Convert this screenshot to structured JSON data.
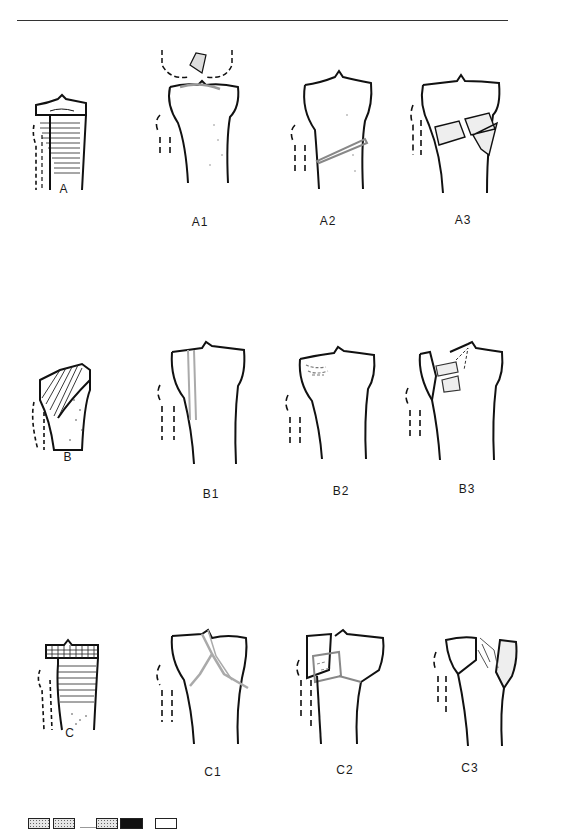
{
  "figure": {
    "type": "fracture-classification-diagram",
    "rows": [
      {
        "group": "A",
        "label": "A",
        "variants": [
          {
            "label": "A1"
          },
          {
            "label": "A2"
          },
          {
            "label": "A3"
          }
        ]
      },
      {
        "group": "B",
        "label": "B",
        "variants": [
          {
            "label": "B1"
          },
          {
            "label": "B2"
          },
          {
            "label": "B3"
          }
        ]
      },
      {
        "group": "C",
        "label": "C",
        "variants": [
          {
            "label": "C1"
          },
          {
            "label": "C2"
          },
          {
            "label": "C3"
          }
        ]
      }
    ],
    "legend": {
      "swatches": [
        "stippled",
        "stippled",
        "dash",
        "stippled",
        "black",
        "white"
      ]
    },
    "colors": {
      "outline": "#111111",
      "fracture_line": "#999999",
      "background": "#ffffff",
      "stipple": "#666666"
    }
  }
}
